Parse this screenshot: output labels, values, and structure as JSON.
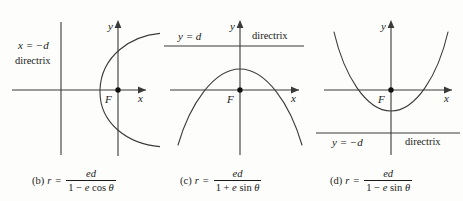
{
  "figure": {
    "type": "conic-sections-polar-equations",
    "background_color": "#fdfdfb",
    "stroke_color": "#3a3a3a",
    "panels": [
      {
        "tag": "(b)",
        "axis_x_label": "x",
        "axis_y_label": "y",
        "focus_label": "F",
        "directrix_equation": "x = −d",
        "directrix_word": "directrix",
        "directrix_orientation": "vertical",
        "conic_opening": "right",
        "equation": {
          "lhs": "r",
          "equals": "=",
          "numerator": "ed",
          "denominator_lead": "1 − ",
          "denominator_var": "e",
          "denominator_func": " cos ",
          "denominator_angle": "θ"
        }
      },
      {
        "tag": "(c)",
        "axis_x_label": "x",
        "axis_y_label": "y",
        "focus_label": "F",
        "directrix_equation": "y = d",
        "directrix_word": "directrix",
        "directrix_orientation": "horizontal-above",
        "conic_opening": "down",
        "equation": {
          "lhs": "r",
          "equals": "=",
          "numerator": "ed",
          "denominator_lead": "1 + ",
          "denominator_var": "e",
          "denominator_func": " sin ",
          "denominator_angle": "θ"
        }
      },
      {
        "tag": "(d)",
        "axis_x_label": "x",
        "axis_y_label": "y",
        "focus_label": "F",
        "directrix_equation": "y = −d",
        "directrix_word": "directrix",
        "directrix_orientation": "horizontal-below",
        "conic_opening": "up",
        "equation": {
          "lhs": "r",
          "equals": "=",
          "numerator": "ed",
          "denominator_lead": "1 − ",
          "denominator_var": "e",
          "denominator_func": " sin ",
          "denominator_angle": "θ"
        }
      }
    ]
  }
}
